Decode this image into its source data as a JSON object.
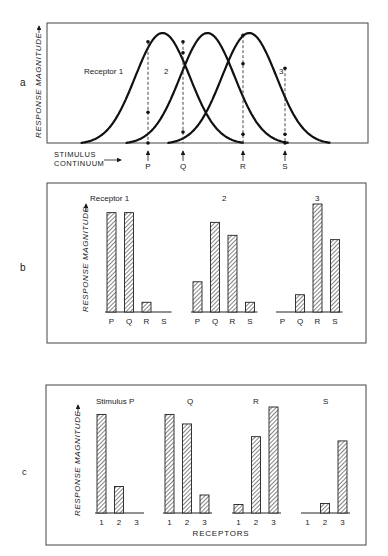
{
  "figure": {
    "panel_labels": [
      "a",
      "b",
      "c"
    ],
    "y_axis_label": "RESPONSE MAGNITUDE",
    "stimulus_axis_label_line1": "STIMULUS",
    "stimulus_axis_label_line2": "CONTINUUM",
    "receptors_axis_label": "RECEPTORS"
  },
  "chart_data": [
    {
      "panel": "a",
      "type": "line",
      "title": "",
      "xlabel": "STIMULUS CONTINUUM",
      "ylabel": "RESPONSE MAGNITUDE",
      "series": [
        {
          "name": "Receptor 1",
          "label": "Receptor 1",
          "peak_position": 0.36,
          "shape": "bell"
        },
        {
          "name": "Receptor 2",
          "label": "2",
          "peak_position": 0.5,
          "shape": "bell"
        },
        {
          "name": "Receptor 3",
          "label": "3",
          "peak_position": 0.63,
          "shape": "bell"
        }
      ],
      "stimulus_markers": [
        {
          "label": "P",
          "receptor_responses": [
            0.92,
            0.28,
            0.0
          ]
        },
        {
          "label": "Q",
          "receptor_responses": [
            0.92,
            0.82,
            0.1
          ]
        },
        {
          "label": "R",
          "receptor_responses": [
            0.08,
            0.72,
            0.98
          ]
        },
        {
          "label": "S",
          "receptor_responses": [
            0.0,
            0.08,
            0.68
          ]
        }
      ],
      "grid": false
    },
    {
      "panel": "b",
      "type": "bar",
      "ylabel": "RESPONSE MAGNITUDE",
      "categories": [
        "P",
        "Q",
        "R",
        "S"
      ],
      "groups_title_prefix": "Receptor",
      "series": [
        {
          "name": "Receptor 1",
          "label": "Receptor  1",
          "values": [
            0.92,
            0.92,
            0.09,
            0.0
          ]
        },
        {
          "name": "Receptor 2",
          "label": "2",
          "values": [
            0.28,
            0.83,
            0.71,
            0.09
          ]
        },
        {
          "name": "Receptor 3",
          "label": "3",
          "values": [
            0.0,
            0.16,
            1.0,
            0.67
          ]
        }
      ],
      "grid": false
    },
    {
      "panel": "c",
      "type": "bar",
      "ylabel": "RESPONSE MAGNITUDE",
      "xlabel": "RECEPTORS",
      "categories": [
        "1",
        "2",
        "3"
      ],
      "series": [
        {
          "name": "Stimulus P",
          "label": "Stimulus P",
          "values": [
            0.93,
            0.25,
            0.0
          ]
        },
        {
          "name": "Q",
          "label": "Q",
          "values": [
            0.93,
            0.84,
            0.17
          ]
        },
        {
          "name": "R",
          "label": "R",
          "values": [
            0.08,
            0.72,
            1.0
          ]
        },
        {
          "name": "S",
          "label": "S",
          "values": [
            0.0,
            0.09,
            0.68
          ]
        }
      ],
      "grid": false
    }
  ]
}
